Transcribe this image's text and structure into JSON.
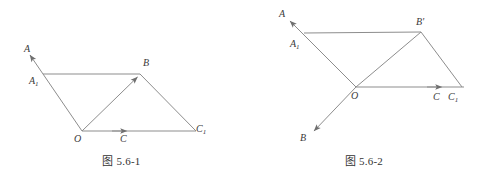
{
  "page": {
    "background_color": "#ffffff",
    "stroke_color": "#8a8a8a",
    "label_color": "#3a3a3a",
    "width": 485,
    "height": 181
  },
  "figures": [
    {
      "id": "figure-1",
      "caption": "图 5.6-1",
      "labels": {
        "A": "A",
        "A1_base": "A",
        "A1_sub": "1",
        "B": "B",
        "O": "O",
        "C": "C",
        "C1_base": "C",
        "C1_sub": "1"
      },
      "geometry": {
        "O": [
          82,
          131
        ],
        "A1": [
          43,
          74
        ],
        "A_arrow_tip": [
          27,
          51
        ],
        "B": [
          140,
          74
        ],
        "C": [
          124,
          131
        ],
        "C1": [
          196,
          131
        ],
        "segments": [
          {
            "name": "segment-A1-B",
            "from": [
              43,
              74
            ],
            "to": [
              140,
              74
            ]
          },
          {
            "name": "segment-B-C1",
            "from": [
              140,
              74
            ],
            "to": [
              196,
              131
            ]
          },
          {
            "name": "vector-O-A",
            "from": [
              82,
              131
            ],
            "to": [
              27,
              51
            ],
            "arrow_at_end": true
          },
          {
            "name": "vector-O-B",
            "from": [
              82,
              131
            ],
            "to": [
              140,
              74
            ],
            "arrow_at_end": true
          },
          {
            "name": "vector-O-C1",
            "from": [
              82,
              131
            ],
            "to": [
              196,
              131
            ],
            "arrow_at_mid": true
          }
        ]
      }
    },
    {
      "id": "figure-2",
      "caption": "图 5.6-2",
      "labels": {
        "A": "A",
        "A1_base": "A",
        "A1_sub": "1",
        "Bprime_base": "B",
        "Bprime_mark": "'",
        "B": "B",
        "O": "O",
        "C": "C",
        "C1_base": "C",
        "C1_sub": "1"
      },
      "geometry": {
        "O": [
          113,
          87
        ],
        "A1": [
          61,
          33
        ],
        "A_arrow_tip": [
          44,
          17
        ],
        "Bprime": [
          178,
          32
        ],
        "B_arrow_tip": [
          68,
          135
        ],
        "C": [
          196,
          87
        ],
        "C1": [
          215,
          87
        ],
        "segments": [
          {
            "name": "segment-A1-Bprime",
            "from": [
              61,
              33
            ],
            "to": [
              178,
              32
            ]
          },
          {
            "name": "segment-Bprime-C1",
            "from": [
              178,
              32
            ],
            "to": [
              219,
              87
            ]
          },
          {
            "name": "vector-O-A",
            "from": [
              113,
              87
            ],
            "to": [
              44,
              17
            ],
            "arrow_at_end": true
          },
          {
            "name": "vector-O-B",
            "from": [
              113,
              87
            ],
            "to": [
              68,
              135
            ],
            "arrow_at_end": true
          },
          {
            "name": "vector-O-Bprime",
            "from": [
              113,
              87
            ],
            "to": [
              178,
              32
            ]
          },
          {
            "name": "vector-O-C1",
            "from": [
              113,
              87
            ],
            "to": [
              219,
              87
            ],
            "arrow_near_end": true
          }
        ]
      }
    }
  ]
}
